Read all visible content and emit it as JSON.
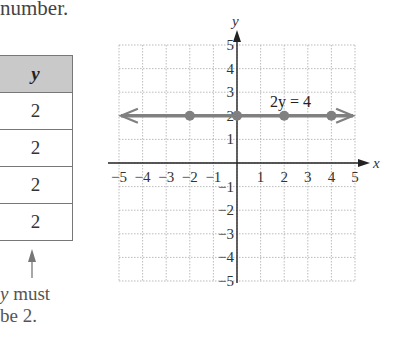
{
  "intro_text": "number.",
  "table": {
    "header": "y",
    "rows": [
      "2",
      "2",
      "2",
      "2"
    ]
  },
  "note": {
    "var": "y",
    "line1_rest": " must",
    "line2": "be 2."
  },
  "chart_data": {
    "type": "line",
    "title": "",
    "xlabel": "x",
    "ylabel": "y",
    "xlim": [
      -5,
      5
    ],
    "ylim": [
      -5,
      5
    ],
    "grid": true,
    "x_ticks": [
      "-5",
      "-4",
      "-3",
      "-2",
      "-1",
      "1",
      "2",
      "3",
      "4",
      "5"
    ],
    "y_ticks": [
      "5",
      "4",
      "3",
      "2",
      "1",
      "-1",
      "-2",
      "-3",
      "-4",
      "-5"
    ],
    "annotation": "2y = 4",
    "series": [
      {
        "name": "2y = 4",
        "equation": "y = 2",
        "points": [
          [
            -2,
            2
          ],
          [
            0,
            2
          ],
          [
            2,
            2
          ],
          [
            4,
            2
          ]
        ],
        "arrows_both_ends": true,
        "color": "#808080"
      }
    ]
  }
}
